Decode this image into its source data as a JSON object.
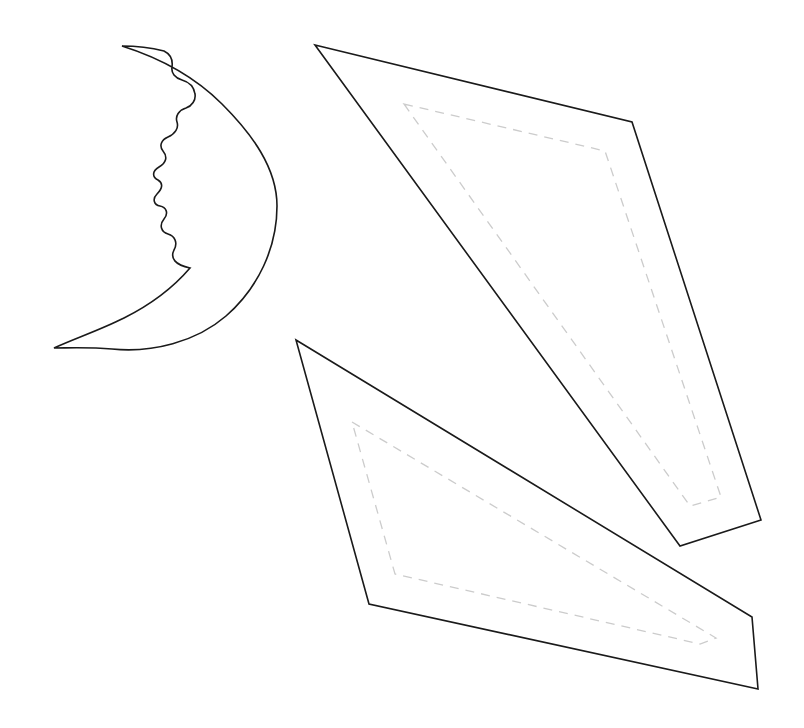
{
  "sheet": {
    "title": "Crescent Moon and Wing Pattern Pieces",
    "background_color": "#ffffff",
    "width": 804,
    "height": 728
  },
  "style": {
    "cut_line_color": "#1a1a1a",
    "cut_line_width": 1.6,
    "fold_line_color": "#cccccc",
    "fold_line_width": 1.3,
    "fold_dash_pattern": "9 7",
    "fill_color": "#ffffff"
  },
  "pieces": [
    {
      "id": "crescent-moon",
      "label": "Crescent Moon With Face Profile",
      "line_type": "solid-cut",
      "has_fold_lines": false,
      "bounds": {
        "x": 54,
        "y": 46,
        "width": 223,
        "height": 302
      },
      "key_points": {
        "top_tip": [
          122,
          46
        ],
        "bottom_tip": [
          54,
          348
        ],
        "rightmost": [
          277,
          205
        ]
      },
      "outline_path": "M 122 46 C 160 58 196 78 222 104 C 252 134 277 168 277 206 C 277 248 258 288 226 316 C 196 342 152 353 112 349 C 88 347 68 348 54 348 C 76 338 100 330 124 318 C 150 305 172 289 190 268 C 175 265 170 258 174 250 C 178 243 175 236 168 234 C 161 232 159 225 164 219 C 169 213 166 207 160 206 C 154 205 152 199 157 194 C 163 188 163 183 158 180 C 152 177 152 171 159 167 C 166 163 168 157 163 151 C 159 146 161 140 168 137 C 175 134 179 128 177 122 C 175 116 179 110 186 108 C 192 106 196 100 195 94 C 194 87 189 82 182 80 C 175 78 171 73 172 67 C 173 60 170 54 164 51 C 152 48 136 46 122 46 Z",
      "face_detail": {
        "description": "Notched profile along the inner concave edge forming a nose, lips, and chin",
        "region": [
          152,
          160,
          50,
          120
        ]
      }
    },
    {
      "id": "wing-upper-right",
      "label": "Upper Right Wing Panel",
      "line_type": "solid-cut",
      "has_fold_lines": true,
      "bounds": {
        "x": 315,
        "y": 45,
        "width": 446,
        "height": 501
      },
      "cut_vertices": [
        [
          315,
          45
        ],
        [
          632,
          122
        ],
        [
          761,
          520
        ],
        [
          680,
          546
        ]
      ],
      "fold_vertices": [
        [
          404,
          104
        ],
        [
          605,
          151
        ],
        [
          721,
          497
        ],
        [
          690,
          506
        ]
      ],
      "cut_path": "M 315 45 L 632 122 L 761 520 L 680 546 Z",
      "fold_path": "M 404 104 L 605 151 L 721 497 L 690 506 Z"
    },
    {
      "id": "wing-lower-right",
      "label": "Lower Right Wing Panel",
      "line_type": "solid-cut",
      "has_fold_lines": true,
      "bounds": {
        "x": 296,
        "y": 340,
        "width": 462,
        "height": 349
      },
      "cut_vertices": [
        [
          296,
          340
        ],
        [
          752,
          617
        ],
        [
          758,
          689
        ],
        [
          369,
          604
        ]
      ],
      "fold_vertices": [
        [
          352,
          422
        ],
        [
          716,
          638
        ],
        [
          700,
          644
        ],
        [
          395,
          574
        ]
      ],
      "cut_path": "M 296 340 L 752 617 L 758 689 L 369 604 Z",
      "fold_path": "M 352 422 L 716 638 L 700 644 L 395 574 Z"
    }
  ]
}
